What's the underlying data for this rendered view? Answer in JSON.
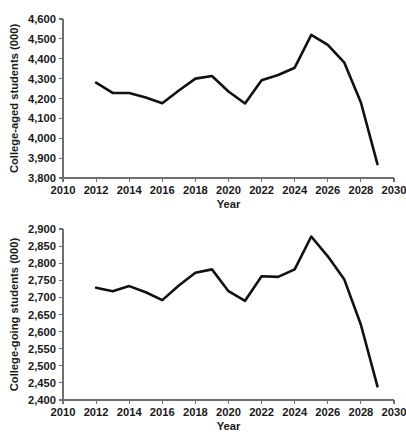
{
  "chart_data": [
    {
      "id": "college-aged",
      "type": "line",
      "title": "",
      "xlabel": "Year",
      "ylabel": "College-aged students (000)",
      "xlim": [
        2010,
        2030
      ],
      "ylim": [
        3800,
        4600
      ],
      "xticks": [
        2010,
        2012,
        2014,
        2016,
        2018,
        2020,
        2022,
        2024,
        2026,
        2028,
        2030
      ],
      "xtick_labels": [
        "2010",
        "2012",
        "2014",
        "2016",
        "2018",
        "2020",
        "2022",
        "2024",
        "2026",
        "2028",
        "2030"
      ],
      "yticks": [
        3800,
        3900,
        4000,
        4100,
        4200,
        4300,
        4400,
        4500,
        4600
      ],
      "ytick_labels": [
        "3,800",
        "3,900",
        "4,000",
        "4,100",
        "4,200",
        "4,300",
        "4,400",
        "4,500",
        "4,600"
      ],
      "grid": false,
      "legend": "none",
      "line_color": "#111111",
      "x": [
        2012,
        2013,
        2014,
        2015,
        2016,
        2017,
        2018,
        2019,
        2020,
        2021,
        2022,
        2023,
        2024,
        2025,
        2026,
        2027,
        2028,
        2029
      ],
      "values": [
        4280,
        4228,
        4228,
        4205,
        4176,
        4240,
        4300,
        4313,
        4235,
        4175,
        4292,
        4318,
        4355,
        4520,
        4470,
        4380,
        4180,
        3870
      ]
    },
    {
      "id": "college-going",
      "type": "line",
      "title": "",
      "xlabel": "Year",
      "ylabel": "College-going students (000)",
      "xlim": [
        2010,
        2030
      ],
      "ylim": [
        2400,
        2900
      ],
      "xticks": [
        2010,
        2012,
        2014,
        2016,
        2018,
        2020,
        2022,
        2024,
        2026,
        2028,
        2030
      ],
      "xtick_labels": [
        "2010",
        "2012",
        "2014",
        "2016",
        "2018",
        "2020",
        "2022",
        "2024",
        "2026",
        "2028",
        "2030"
      ],
      "yticks": [
        2400,
        2450,
        2500,
        2550,
        2600,
        2650,
        2700,
        2750,
        2800,
        2850,
        2900
      ],
      "ytick_labels": [
        "2,400",
        "2,450",
        "2,500",
        "2,550",
        "2,600",
        "2,650",
        "2,700",
        "2,750",
        "2,800",
        "2,850",
        "2,900"
      ],
      "grid": false,
      "legend": "none",
      "line_color": "#111111",
      "x": [
        2012,
        2013,
        2014,
        2015,
        2016,
        2017,
        2018,
        2019,
        2020,
        2021,
        2022,
        2023,
        2024,
        2025,
        2026,
        2027,
        2028,
        2029
      ],
      "values": [
        2728,
        2718,
        2733,
        2715,
        2692,
        2735,
        2772,
        2782,
        2718,
        2690,
        2762,
        2760,
        2782,
        2878,
        2820,
        2752,
        2620,
        2440
      ]
    }
  ]
}
